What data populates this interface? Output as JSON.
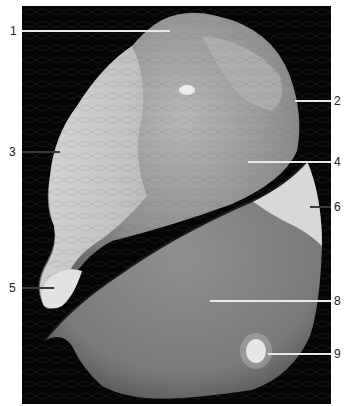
{
  "figure": {
    "background": "#050505"
  },
  "labels": [
    {
      "id": "1",
      "text": "1"
    },
    {
      "id": "2",
      "text": "2"
    },
    {
      "id": "3",
      "text": "3"
    },
    {
      "id": "4",
      "text": "4"
    },
    {
      "id": "5",
      "text": "5"
    },
    {
      "id": "6",
      "text": "6"
    },
    {
      "id": "8",
      "text": "8"
    },
    {
      "id": "9",
      "text": "9"
    }
  ]
}
